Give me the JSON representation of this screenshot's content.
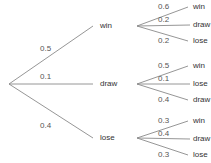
{
  "colors": {
    "line": "#8a8a8a",
    "text": "#333333"
  },
  "root": {
    "x": 9,
    "y": 84
  },
  "level1": [
    {
      "outcome": "win",
      "prob": "0.5",
      "end": [
        93,
        26
      ],
      "label_pos": [
        100,
        22
      ],
      "prob_pos": [
        40,
        45
      ],
      "children": [
        {
          "outcome": "win",
          "prob": "0.6",
          "end": [
            188,
            7
          ],
          "label_pos": [
            193,
            3
          ],
          "prob_pos": [
            158,
            3
          ]
        },
        {
          "outcome": "draw",
          "prob": "0.2",
          "end": [
            190,
            25
          ],
          "label_pos": [
            193,
            21
          ],
          "prob_pos": [
            158,
            16
          ]
        },
        {
          "outcome": "lose",
          "prob": "0.2",
          "end": [
            188,
            41
          ],
          "label_pos": [
            193,
            37
          ],
          "prob_pos": [
            158,
            37
          ]
        }
      ]
    },
    {
      "outcome": "draw",
      "prob": "0.1",
      "end": [
        93,
        84
      ],
      "label_pos": [
        100,
        80
      ],
      "prob_pos": [
        40,
        73
      ],
      "children": [
        {
          "outcome": "win",
          "prob": "0.5",
          "end": [
            188,
            66
          ],
          "label_pos": [
            193,
            62
          ],
          "prob_pos": [
            158,
            62
          ]
        },
        {
          "outcome": "lose",
          "prob": "0.1",
          "end": [
            190,
            84
          ],
          "label_pos": [
            193,
            80
          ],
          "prob_pos": [
            158,
            75
          ]
        },
        {
          "outcome": "draw",
          "prob": "0.4",
          "end": [
            188,
            100
          ],
          "label_pos": [
            193,
            96
          ],
          "prob_pos": [
            158,
            96
          ]
        }
      ]
    },
    {
      "outcome": "lose",
      "prob": "0.4",
      "end": [
        93,
        138
      ],
      "label_pos": [
        100,
        134
      ],
      "prob_pos": [
        40,
        122
      ],
      "children": [
        {
          "outcome": "win",
          "prob": "0.3",
          "end": [
            188,
            121
          ],
          "label_pos": [
            193,
            117
          ],
          "prob_pos": [
            158,
            117
          ]
        },
        {
          "outcome": "draw",
          "prob": "0.4",
          "end": [
            190,
            139
          ],
          "label_pos": [
            193,
            135
          ],
          "prob_pos": [
            158,
            130
          ]
        },
        {
          "outcome": "lose",
          "prob": "0.3",
          "end": [
            188,
            155
          ],
          "label_pos": [
            193,
            151
          ],
          "prob_pos": [
            158,
            151
          ]
        }
      ]
    }
  ]
}
